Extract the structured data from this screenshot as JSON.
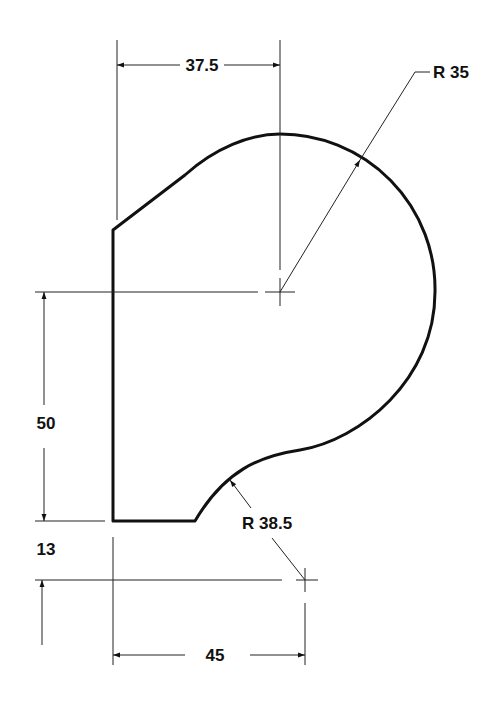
{
  "drawing": {
    "type": "engineering-profile-drawing",
    "colors": {
      "line": "#111111",
      "background": "#ffffff"
    },
    "dimensions": {
      "top_width": {
        "label": "37.5"
      },
      "large_radius": {
        "label": "R 35"
      },
      "height": {
        "label": "50"
      },
      "small_radius": {
        "label": "R 38.5"
      },
      "offset": {
        "label": "13"
      },
      "bottom_width": {
        "label": "45"
      }
    }
  }
}
